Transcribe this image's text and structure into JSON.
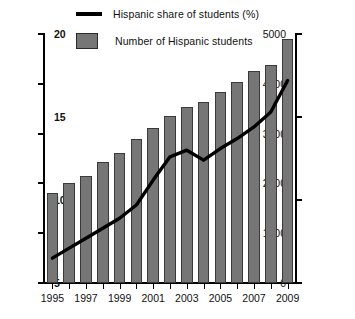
{
  "legend": {
    "line_label": "Hispanic share of students (%)",
    "bar_label": "Number of Hispanic students",
    "line_color": "#000000",
    "bar_color": "#767676"
  },
  "axes": {
    "left_ticks": [
      "0",
      "1000",
      "2000",
      "3000",
      "4000",
      "5000"
    ],
    "right_ticks": [
      "5",
      "10",
      "15",
      "20"
    ],
    "x_ticks": [
      "1995",
      "1997",
      "1999",
      "2001",
      "2003",
      "2005",
      "2007",
      "2009"
    ]
  },
  "chart_data": {
    "type": "bar",
    "title": "",
    "subtitle": "",
    "xlabel": "",
    "ylabel": "",
    "y2label": "",
    "grid": false,
    "legend_position": "top",
    "categories": [
      "1995",
      "1996",
      "1997",
      "1998",
      "1999",
      "2000",
      "2001",
      "2002",
      "2003",
      "2004",
      "2005",
      "2006",
      "2007",
      "2008",
      "2009"
    ],
    "xtick_labels": [
      "1995",
      "",
      "1997",
      "",
      "1999",
      "",
      "2001",
      "",
      "2003",
      "",
      "2005",
      "",
      "2007",
      "",
      "2009"
    ],
    "ylim": [
      0,
      5000
    ],
    "y2lim": [
      5,
      20
    ],
    "yticks": [
      0,
      1000,
      2000,
      3000,
      4000,
      5000
    ],
    "y2ticks": [
      5,
      10,
      15,
      20
    ],
    "series": [
      {
        "name": "Number of Hispanic students",
        "type": "bar",
        "axis": "left",
        "color": "#767676",
        "values": [
          1800,
          2000,
          2150,
          2420,
          2620,
          2890,
          3120,
          3360,
          3540,
          3640,
          3840,
          4030,
          4250,
          4380,
          4900
        ]
      },
      {
        "name": "Hispanic share of students (%)",
        "type": "line",
        "axis": "right",
        "color": "#000000",
        "values": [
          6.5,
          7.1,
          7.7,
          8.3,
          8.9,
          9.7,
          11.2,
          12.6,
          13.0,
          12.4,
          13.1,
          13.7,
          14.4,
          15.3,
          17.2
        ]
      }
    ]
  }
}
